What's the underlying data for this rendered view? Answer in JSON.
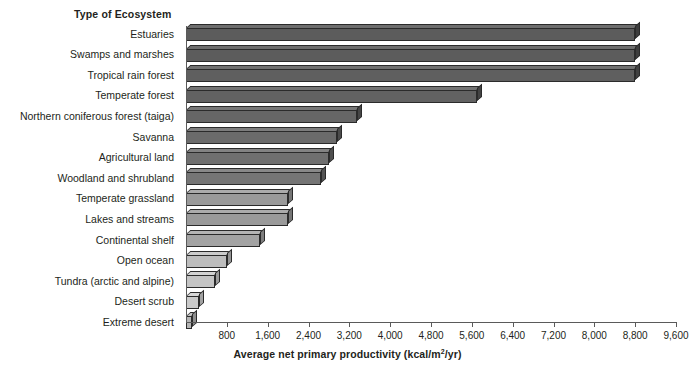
{
  "chart_data": {
    "type": "bar",
    "orientation": "horizontal",
    "title": "",
    "category_axis_title": "Type of Ecosystem",
    "xlabel": "Average net primary productivity (kcal/m",
    "xlabel_sup": "2",
    "xlabel_tail": "/yr)",
    "xlabel_full": "Average net primary productivity (kcal/m2/yr)",
    "ylabel": "Type of Ecosystem",
    "xlim": [
      0,
      9600
    ],
    "grid": false,
    "legend": "none",
    "xticks": [
      800,
      1600,
      2400,
      3200,
      4000,
      4800,
      5600,
      6400,
      7200,
      8000,
      8800,
      9600
    ],
    "xtick_labels": [
      "800",
      "1,600",
      "2,400",
      "3,200",
      "4,000",
      "4,800",
      "5,600",
      "6,400",
      "7,200",
      "8,000",
      "8,800",
      "9,600"
    ],
    "categories": [
      "Estuaries",
      "Swamps and marshes",
      "Tropical rain forest",
      "Temperate forest",
      "Northern coniferous forest (taiga)",
      "Savanna",
      "Agricultural land",
      "Woodland and shrubland",
      "Temperate grassland",
      "Lakes and streams",
      "Continental shelf",
      "Open ocean",
      "Tundra (arctic and alpine)",
      "Desert scrub",
      "Extreme desert"
    ],
    "values": [
      8800,
      8800,
      8800,
      5700,
      3350,
      2950,
      2800,
      2650,
      2000,
      2000,
      1450,
      800,
      570,
      250,
      120
    ],
    "bars": [
      {
        "label": "Estuaries",
        "value": 8800,
        "color": "#5c5c5c",
        "top_color": "#6e6e6e",
        "side_color": "#3d3d3d"
      },
      {
        "label": "Swamps and marshes",
        "value": 8800,
        "color": "#5c5c5c",
        "top_color": "#6e6e6e",
        "side_color": "#3d3d3d"
      },
      {
        "label": "Tropical rain forest",
        "value": 8800,
        "color": "#5f5f5f",
        "top_color": "#717171",
        "side_color": "#404040"
      },
      {
        "label": "Temperate forest",
        "value": 5700,
        "color": "#626262",
        "top_color": "#747474",
        "side_color": "#434343"
      },
      {
        "label": "Northern coniferous forest (taiga)",
        "value": 3350,
        "color": "#666666",
        "top_color": "#787878",
        "side_color": "#464646"
      },
      {
        "label": "Savanna",
        "value": 2950,
        "color": "#6b6b6b",
        "top_color": "#7d7d7d",
        "side_color": "#4b4b4b"
      },
      {
        "label": "Agricultural land",
        "value": 2800,
        "color": "#6f6f6f",
        "top_color": "#828282",
        "side_color": "#4f4f4f"
      },
      {
        "label": "Woodland and shrubland",
        "value": 2650,
        "color": "#757575",
        "top_color": "#888888",
        "side_color": "#545454"
      },
      {
        "label": "Temperate grassland",
        "value": 2000,
        "color": "#9a9a9a",
        "top_color": "#ababab",
        "side_color": "#767676"
      },
      {
        "label": "Lakes and streams",
        "value": 2000,
        "color": "#9a9a9a",
        "top_color": "#ababab",
        "side_color": "#767676"
      },
      {
        "label": "Continental shelf",
        "value": 1450,
        "color": "#a3a3a3",
        "top_color": "#b4b4b4",
        "side_color": "#7e7e7e"
      },
      {
        "label": "Open ocean",
        "value": 800,
        "color": "#bdbdbd",
        "top_color": "#cccccc",
        "side_color": "#959595"
      },
      {
        "label": "Tundra (arctic and alpine)",
        "value": 570,
        "color": "#c4c4c4",
        "top_color": "#d3d3d3",
        "side_color": "#9c9c9c"
      },
      {
        "label": "Desert scrub",
        "value": 250,
        "color": "#cacaca",
        "top_color": "#d8d8d8",
        "side_color": "#a2a2a2"
      },
      {
        "label": "Extreme desert",
        "value": 120,
        "color": "#b5b5b5",
        "top_color": "#c4c4c4",
        "side_color": "#8e8e8e"
      }
    ]
  }
}
